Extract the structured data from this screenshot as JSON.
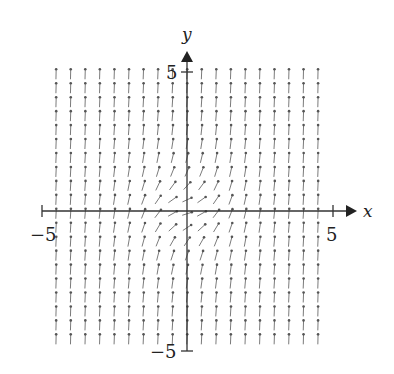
{
  "chart_data": {
    "type": "vector_field",
    "title": "",
    "xlabel": "x",
    "ylabel": "y",
    "xlim": [
      -5,
      5
    ],
    "ylim": [
      -5,
      5
    ],
    "x_ticks": [
      {
        "value": -5,
        "label": "−5"
      },
      {
        "value": 5,
        "label": "5"
      }
    ],
    "y_ticks": [
      {
        "value": 5,
        "label": "5"
      },
      {
        "value": -5,
        "label": "−5"
      }
    ],
    "grid": false,
    "legend": null,
    "field": {
      "description": "direction field; all arrows point upward, nearly vertical far from origin, tilting toward horizontal (slope ~0.3) near origin",
      "dx": "1",
      "dy": "0.3 + x^2 + y^2",
      "sample_x": {
        "start": -4.5,
        "stop": 4.5,
        "step": 0.5
      },
      "sample_y": {
        "start": -4.6,
        "stop": 4.9,
        "step": 0.5
      },
      "arrow_length_px": 10
    },
    "colors": {
      "axis": "#333333",
      "arrow": "#6b6b6b",
      "text": "#222222"
    }
  }
}
